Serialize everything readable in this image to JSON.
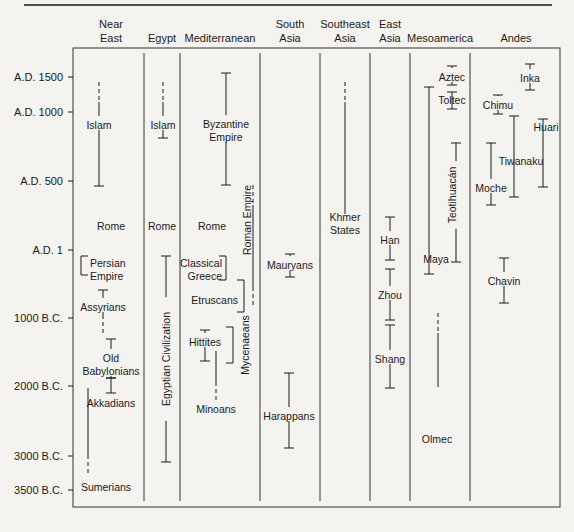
{
  "chart_data": {
    "type": "timeline",
    "title": "",
    "colors": {
      "ink": "#1a1a1a",
      "paper": "#f4f3f0"
    },
    "time_axis": {
      "ticks": [
        {
          "label": "A.D. 1500",
          "y": 77
        },
        {
          "label": "A.D. 1000",
          "y": 112
        },
        {
          "label": "A.D. 500",
          "y": 181
        },
        {
          "label": "A.D. 1",
          "y": 250
        },
        {
          "label": "1000 B.C.",
          "y": 318
        },
        {
          "label": "2000 B.C.",
          "y": 386
        },
        {
          "label": "3000 B.C.",
          "y": 456
        },
        {
          "label": "3500 B.C.",
          "y": 490
        }
      ]
    },
    "regions": [
      {
        "name": "Near East",
        "lines": [
          "Near",
          "East"
        ],
        "cx": 111
      },
      {
        "name": "Egypt",
        "lines": [
          "Egypt"
        ],
        "cx": 162
      },
      {
        "name": "Mediterranean",
        "lines": [
          "Mediterranean"
        ],
        "cx": 220
      },
      {
        "name": "South Asia",
        "lines": [
          "South",
          "Asia"
        ],
        "cx": 290
      },
      {
        "name": "Southeast Asia",
        "lines": [
          "Southeast",
          "Asia"
        ],
        "cx": 345
      },
      {
        "name": "East Asia",
        "lines": [
          "East",
          "Asia"
        ],
        "cx": 390
      },
      {
        "name": "Mesoamerica",
        "lines": [
          "Mesoamerica"
        ],
        "cx": 440
      },
      {
        "name": "Andes",
        "lines": [
          "Andes"
        ],
        "cx": 516
      }
    ],
    "column_dividers_x": [
      144,
      180,
      260,
      320,
      370,
      410,
      470
    ],
    "civilizations": [
      {
        "region": "Near East",
        "label": [
          "Islam"
        ],
        "x": 99,
        "y1": 82,
        "y2": 186,
        "dashed_top": true,
        "lx": 99,
        "ly": 126
      },
      {
        "region": "Near East",
        "label": [
          "Rome"
        ],
        "text_only": true,
        "lx": 111,
        "ly": 227
      },
      {
        "region": "Near East",
        "label": [
          "Persian",
          "Empire"
        ],
        "x": 81,
        "y1": 256,
        "y2": 275,
        "bracket": "left",
        "lx": 90,
        "ly": 264,
        "anchor": "start"
      },
      {
        "region": "Near East",
        "label": [
          "Assyrians"
        ],
        "x": 103,
        "y1": 290,
        "y2": 335,
        "dashed_bottom": true,
        "lx": 103,
        "ly": 308
      },
      {
        "region": "Near East",
        "label": [
          "Old",
          "Babylonians"
        ],
        "x": 111,
        "y1": 339,
        "y2": 378,
        "lx": 111,
        "ly": 359
      },
      {
        "region": "Near East",
        "label": [
          "Akkadians"
        ],
        "x": 111,
        "y1": 378,
        "y2": 393,
        "lx": 111,
        "ly": 404
      },
      {
        "region": "Near East",
        "label": [
          "Sumerians"
        ],
        "x": 88,
        "y1": 388,
        "y2": 475,
        "dashed_bottom": true,
        "no_caps": true,
        "lx": 106,
        "ly": 488
      },
      {
        "region": "Egypt",
        "label": [
          "Islam"
        ],
        "x": 163,
        "y1": 82,
        "y2": 138,
        "dashed_top": true,
        "lx": 163,
        "ly": 126
      },
      {
        "region": "Egypt",
        "label": [
          "Rome"
        ],
        "text_only": true,
        "lx": 162,
        "ly": 227
      },
      {
        "region": "Egypt",
        "label": [
          "Egyptian Civilization"
        ],
        "x": 166,
        "y1": 256,
        "y2": 462,
        "vertical_text": true,
        "lx": 166,
        "ly": 359
      },
      {
        "region": "Mediterranean",
        "label": [
          "Byzantine",
          "Empire"
        ],
        "x": 226,
        "y1": 73,
        "y2": 185,
        "lx": 226,
        "ly": 125
      },
      {
        "region": "Mediterranean",
        "label": [
          "Rome"
        ],
        "text_only": true,
        "lx": 212,
        "ly": 227
      },
      {
        "region": "Mediterranean",
        "label": [
          "Roman Empire"
        ],
        "x": 253,
        "y1": 185,
        "y2": 307,
        "dashed_both": true,
        "vertical_text": true,
        "lx": 247,
        "ly": 220
      },
      {
        "region": "Mediterranean",
        "label": [
          "Classical",
          "Greece"
        ],
        "x": 226,
        "y1": 256,
        "y2": 280,
        "bracket": "right",
        "lx": 222,
        "ly": 264,
        "anchor": "end"
      },
      {
        "region": "Mediterranean",
        "label": [
          "Etruscans"
        ],
        "x": 244,
        "y1": 280,
        "y2": 312,
        "bracket": "right",
        "lx": 238,
        "ly": 301,
        "anchor": "end"
      },
      {
        "region": "Mediterranean",
        "label": [
          "Hittites"
        ],
        "x": 205,
        "y1": 330,
        "y2": 361,
        "lx": 205,
        "ly": 343
      },
      {
        "region": "Mediterranean",
        "label": [
          "Mycenaeans"
        ],
        "x": 233,
        "y1": 327,
        "y2": 363,
        "bracket": "right",
        "vertical_text": true,
        "lx": 245,
        "ly": 345
      },
      {
        "region": "Mediterranean",
        "label": [
          "Minoans"
        ],
        "x": 216,
        "y1": 351,
        "y2": 402,
        "dashed_bottom": true,
        "no_caps": true,
        "lx": 216,
        "ly": 410
      },
      {
        "region": "South Asia",
        "label": [
          "Mauryans"
        ],
        "x": 290,
        "y1": 254,
        "y2": 277,
        "lx": 290,
        "ly": 266
      },
      {
        "region": "South Asia",
        "label": [
          "Harappans"
        ],
        "x": 289,
        "y1": 373,
        "y2": 448,
        "lx": 289,
        "ly": 417
      },
      {
        "region": "Southeast Asia",
        "label": [
          "Khmer",
          "States"
        ],
        "x": 345,
        "y1": 82,
        "y2": 214,
        "dashed_top": true,
        "no_caps": true,
        "lx": 345,
        "ly": 218
      },
      {
        "region": "East Asia",
        "label": [
          "Han"
        ],
        "x": 390,
        "y1": 217,
        "y2": 260,
        "lx": 390,
        "ly": 241
      },
      {
        "region": "East Asia",
        "label": [
          "Zhou"
        ],
        "x": 390,
        "y1": 269,
        "y2": 320,
        "lx": 390,
        "ly": 296
      },
      {
        "region": "East Asia",
        "label": [
          "Shang"
        ],
        "x": 390,
        "y1": 325,
        "y2": 388,
        "lx": 390,
        "ly": 360
      },
      {
        "region": "Mesoamerica",
        "label": [
          "Aztec"
        ],
        "x": 452,
        "y1": 66,
        "y2": 85,
        "lx": 452,
        "ly": 78
      },
      {
        "region": "Mesoamerica",
        "label": [
          "Toltec"
        ],
        "x": 452,
        "y1": 92,
        "y2": 109,
        "lx": 452,
        "ly": 101
      },
      {
        "region": "Mesoamerica",
        "label": [
          "Teotihuacán"
        ],
        "x": 456,
        "y1": 143,
        "y2": 262,
        "vertical_text": true,
        "lx": 452,
        "ly": 195
      },
      {
        "region": "Mesoamerica",
        "label": [
          "Maya"
        ],
        "x": 429,
        "y1": 87,
        "y2": 274,
        "lx": 436,
        "ly": 260
      },
      {
        "region": "Mesoamerica",
        "label": [
          "Olmec"
        ],
        "x": 438,
        "y1": 313,
        "y2": 387,
        "dashed_top": true,
        "no_caps": true,
        "lx": 437,
        "ly": 440
      },
      {
        "region": "Andes",
        "label": [
          "Inka"
        ],
        "x": 530,
        "y1": 64,
        "y2": 90,
        "lx": 530,
        "ly": 79
      },
      {
        "region": "Andes",
        "label": [
          "Chimu"
        ],
        "x": 498,
        "y1": 95,
        "y2": 114,
        "lx": 498,
        "ly": 106
      },
      {
        "region": "Andes",
        "label": [
          "Tiwanaku"
        ],
        "x": 514,
        "y1": 116,
        "y2": 197,
        "lx": 521,
        "ly": 162
      },
      {
        "region": "Andes",
        "label": [
          "Huari"
        ],
        "x": 543,
        "y1": 119,
        "y2": 187,
        "lx": 546,
        "ly": 128
      },
      {
        "region": "Andes",
        "label": [
          "Moche"
        ],
        "x": 491,
        "y1": 143,
        "y2": 205,
        "lx": 491,
        "ly": 189
      },
      {
        "region": "Andes",
        "label": [
          "Chavin"
        ],
        "x": 504,
        "y1": 258,
        "y2": 303,
        "lx": 504,
        "ly": 282
      }
    ]
  }
}
